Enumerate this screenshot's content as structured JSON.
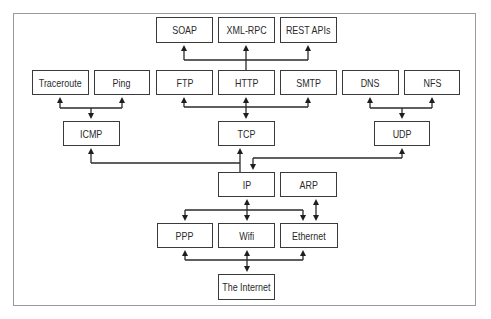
{
  "diagram": {
    "type": "network-protocol-stack",
    "nodes": [
      {
        "id": "soap",
        "label": "SOAP",
        "x": 156,
        "y": 17,
        "w": 57,
        "h": 26
      },
      {
        "id": "xmlrpc",
        "label": "XML-RPC",
        "x": 218,
        "y": 17,
        "w": 57,
        "h": 26
      },
      {
        "id": "rest",
        "label": "REST APIs",
        "x": 280,
        "y": 17,
        "w": 57,
        "h": 26
      },
      {
        "id": "traceroute",
        "label": "Traceroute",
        "x": 32,
        "y": 70,
        "w": 57,
        "h": 25
      },
      {
        "id": "ping",
        "label": "Ping",
        "x": 94,
        "y": 70,
        "w": 56,
        "h": 25
      },
      {
        "id": "ftp",
        "label": "FTP",
        "x": 156,
        "y": 70,
        "w": 57,
        "h": 25
      },
      {
        "id": "http",
        "label": "HTTP",
        "x": 218,
        "y": 70,
        "w": 57,
        "h": 25
      },
      {
        "id": "smtp",
        "label": "SMTP",
        "x": 280,
        "y": 70,
        "w": 57,
        "h": 25
      },
      {
        "id": "dns",
        "label": "DNS",
        "x": 342,
        "y": 70,
        "w": 57,
        "h": 25
      },
      {
        "id": "nfs",
        "label": "NFS",
        "x": 404,
        "y": 70,
        "w": 56,
        "h": 25
      },
      {
        "id": "icmp",
        "label": "ICMP",
        "x": 63,
        "y": 121,
        "w": 57,
        "h": 25
      },
      {
        "id": "tcp",
        "label": "TCP",
        "x": 218,
        "y": 121,
        "w": 57,
        "h": 25
      },
      {
        "id": "udp",
        "label": "UDP",
        "x": 374,
        "y": 121,
        "w": 56,
        "h": 25
      },
      {
        "id": "ip",
        "label": "IP",
        "x": 218,
        "y": 172,
        "w": 57,
        "h": 25
      },
      {
        "id": "arp",
        "label": "ARP",
        "x": 280,
        "y": 172,
        "w": 57,
        "h": 25
      },
      {
        "id": "ppp",
        "label": "PPP",
        "x": 157,
        "y": 223,
        "w": 56,
        "h": 25
      },
      {
        "id": "wifi",
        "label": "Wifi",
        "x": 218,
        "y": 223,
        "w": 57,
        "h": 25
      },
      {
        "id": "ethernet",
        "label": "Ethernet",
        "x": 280,
        "y": 223,
        "w": 58,
        "h": 25
      },
      {
        "id": "internet",
        "label": "The Internet",
        "x": 218,
        "y": 274,
        "w": 57,
        "h": 26
      }
    ],
    "edges": [
      {
        "from": "http",
        "to": "soap"
      },
      {
        "from": "http",
        "to": "xmlrpc"
      },
      {
        "from": "http",
        "to": "rest"
      },
      {
        "from": "icmp",
        "to": "traceroute"
      },
      {
        "from": "icmp",
        "to": "ping"
      },
      {
        "from": "tcp",
        "to": "ftp"
      },
      {
        "from": "tcp",
        "to": "http",
        "bidirectional": true
      },
      {
        "from": "tcp",
        "to": "smtp"
      },
      {
        "from": "udp",
        "to": "dns"
      },
      {
        "from": "udp",
        "to": "nfs"
      },
      {
        "from": "ip",
        "to": "icmp"
      },
      {
        "from": "ip",
        "to": "tcp"
      },
      {
        "from": "ip",
        "to": "udp"
      },
      {
        "from": "ip",
        "to": "ppp"
      },
      {
        "from": "ip",
        "to": "wifi",
        "bidirectional": true
      },
      {
        "from": "ip",
        "to": "ethernet"
      },
      {
        "from": "arp",
        "to": "ethernet",
        "bidirectional": true
      },
      {
        "from": "internet",
        "to": "ppp"
      },
      {
        "from": "internet",
        "to": "wifi",
        "bidirectional": true
      },
      {
        "from": "internet",
        "to": "ethernet"
      }
    ]
  },
  "colors": {
    "box_border": "#3a3a3a",
    "line": "#2a2a2a",
    "frame_border": "#9a9a9a",
    "text": "#2a2a2a",
    "background": "#ffffff"
  }
}
